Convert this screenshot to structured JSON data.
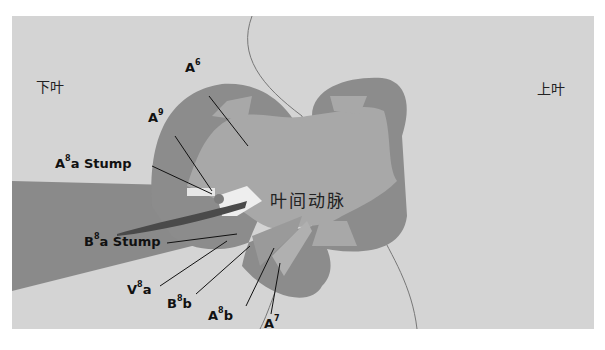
{
  "regions": {
    "lower_lobe": "下叶",
    "upper_lobe": "上叶",
    "interlobar_artery": "叶间动脉"
  },
  "labels": [
    {
      "id": "A6",
      "base": "A",
      "sup": "6",
      "suffix": ""
    },
    {
      "id": "A9",
      "base": "A",
      "sup": "9",
      "suffix": ""
    },
    {
      "id": "A8a-stump",
      "base": "A",
      "sup": "8",
      "suffix": "a Stump"
    },
    {
      "id": "B8a-stump",
      "base": "B",
      "sup": "8",
      "suffix": "a Stump"
    },
    {
      "id": "V8a",
      "base": "V",
      "sup": "8",
      "suffix": "a"
    },
    {
      "id": "B8b",
      "base": "B",
      "sup": "8",
      "suffix": "b"
    },
    {
      "id": "A8b",
      "base": "A",
      "sup": "8",
      "suffix": "b"
    },
    {
      "id": "A7",
      "base": "A",
      "sup": "7",
      "suffix": ""
    }
  ],
  "colors": {
    "background": "#d4d4d4",
    "lobe_tissue": "#8a8a8a",
    "artery": "#a6a6a6",
    "bronchus_stump": "#eeeeee",
    "vein": "#555555",
    "leader_line": "#111111"
  }
}
